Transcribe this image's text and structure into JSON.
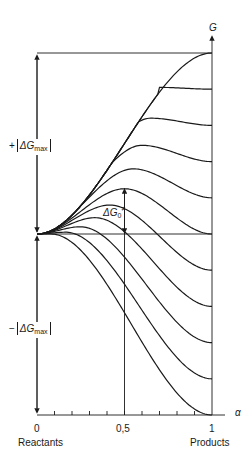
{
  "figure": {
    "axis_g_label": "G",
    "axis_alpha_label": "α",
    "x_ticks": [
      {
        "value": 0,
        "label": "0"
      },
      {
        "value": 0.5,
        "label": "0,5"
      },
      {
        "value": 1,
        "label": "1"
      }
    ],
    "minor_tick_step": 0.1,
    "x_endpoint_labels": {
      "left": "Reactants",
      "right": "Products"
    },
    "upper_bracket": {
      "sign": "+",
      "delta": "ΔG",
      "sub": "max"
    },
    "lower_bracket": {
      "sign": "−",
      "delta": "ΔG",
      "sub": "max"
    },
    "barrier_label": {
      "delta": "ΔG",
      "sub": "0",
      "sup": "≠"
    },
    "line_color": "#1a1a1a"
  },
  "chart_data": {
    "type": "line",
    "title": "",
    "xlabel": "α",
    "ylabel": "G",
    "xlim": [
      0,
      1
    ],
    "ylim_relative": [
      -1,
      1
    ],
    "intrinsic_barrier_relative": 0.25,
    "series_reaction_free_energy_relative": [
      1.0,
      0.8,
      0.6,
      0.4,
      0.2,
      0.0,
      -0.2,
      -0.4,
      -0.6,
      -0.8,
      -1.0
    ],
    "annotations": [
      "+|ΔGmax|",
      "−|ΔGmax|",
      "ΔG0≠ at α = 0,5",
      "Reactants (α = 0)",
      "Products (α = 1)"
    ]
  }
}
